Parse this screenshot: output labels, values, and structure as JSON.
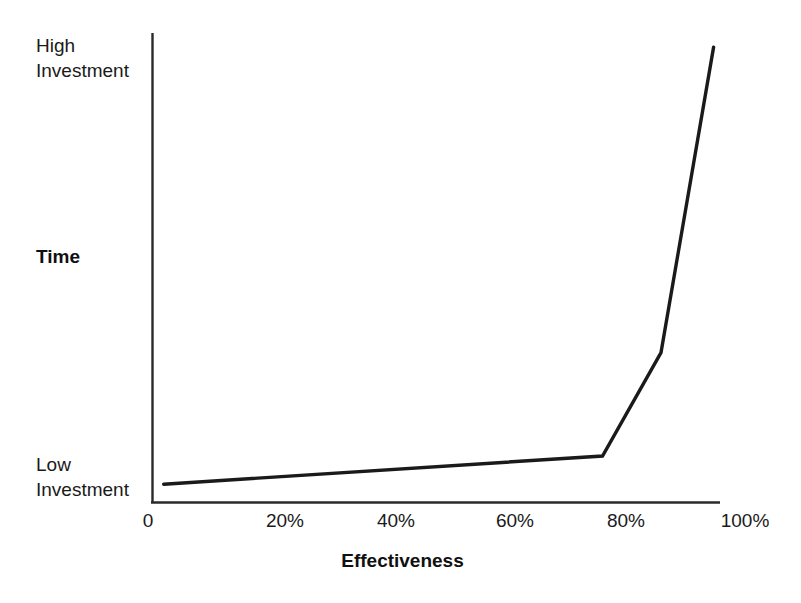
{
  "chart_data": {
    "type": "line",
    "title": "",
    "subtitle": "",
    "xlabel": "Effectiveness",
    "ylabel": "Time",
    "grid": false,
    "legend": "none",
    "xlim": [
      0,
      100
    ],
    "ylim": [
      0,
      100
    ],
    "x_tick_labels": [
      "0",
      "20%",
      "40%",
      "60%",
      "80%",
      "100%"
    ],
    "x_tick_values": [
      0,
      20,
      40,
      60,
      80,
      100
    ],
    "y_axis_low_label": "Low\nInvestment",
    "y_axis_high_label": "High\nInvestment",
    "y_axis_low_label_line1": "Low",
    "y_axis_low_label_line2": "Investment",
    "y_axis_high_label_line1": "High",
    "y_axis_high_label_line2": "Investment",
    "y_tick_labels": [],
    "series": [
      {
        "name": "Investment vs Effectiveness",
        "x": [
          2,
          77,
          87,
          96
        ],
        "y": [
          4,
          10,
          32,
          97
        ],
        "color": "#1a1a1a",
        "line_width": 3.4,
        "markers": false
      }
    ],
    "annotations": [],
    "axis_color": "#2a2a2a",
    "background_color": "#ffffff"
  },
  "axes": {
    "x_axis_title": "Effectiveness",
    "y_axis_title": "Time",
    "y_high_line1": "High",
    "y_high_line2": "Investment",
    "y_low_line1": "Low",
    "y_low_line2": "Investment",
    "ticks": [
      {
        "label": "0",
        "cx": 148
      },
      {
        "label": "20%",
        "cx": 285
      },
      {
        "label": "40%",
        "cx": 396
      },
      {
        "label": "60%",
        "cx": 515
      },
      {
        "label": "80%",
        "cx": 626
      },
      {
        "label": "100%",
        "cx": 745
      }
    ]
  },
  "colors": {
    "ink": "#1a1a1a",
    "axis": "#2a2a2a",
    "curve": "#1a1a1a",
    "background": "#ffffff"
  }
}
